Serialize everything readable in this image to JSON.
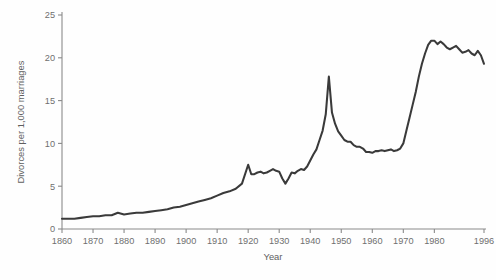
{
  "chart_data": {
    "type": "line",
    "title": "",
    "xlabel": "Year",
    "ylabel": "Divorces per 1,000 marriages",
    "xlim": [
      1860,
      1996
    ],
    "ylim": [
      0,
      25
    ],
    "grid": false,
    "legend": "none",
    "xticks": [
      1860,
      1870,
      1880,
      1890,
      1900,
      1910,
      1920,
      1930,
      1940,
      1950,
      1960,
      1970,
      1980,
      1996
    ],
    "xticklabels": [
      "1860",
      "1870",
      "1880",
      "1890",
      "1900",
      "1910",
      "1920",
      "1930",
      "1940",
      "1950",
      "1960",
      "1970",
      "1980",
      "1996"
    ],
    "yticks": [
      0,
      5,
      10,
      15,
      20,
      25
    ],
    "yticklabels": [
      "0",
      "5",
      "10",
      "15",
      "20",
      "25"
    ],
    "line_color": "#3a3a3a",
    "axis_color": "#8a8a8a",
    "background_color": "#ffffff",
    "series": [
      {
        "name": "Divorces per 1,000 marriages",
        "x": [
          1860,
          1862,
          1864,
          1866,
          1868,
          1870,
          1872,
          1874,
          1876,
          1878,
          1880,
          1882,
          1884,
          1886,
          1888,
          1890,
          1892,
          1894,
          1896,
          1898,
          1900,
          1902,
          1904,
          1906,
          1908,
          1910,
          1912,
          1914,
          1916,
          1918,
          1920,
          1921,
          1922,
          1923,
          1924,
          1925,
          1926,
          1927,
          1928,
          1929,
          1930,
          1931,
          1932,
          1933,
          1934,
          1935,
          1936,
          1937,
          1938,
          1939,
          1940,
          1941,
          1942,
          1943,
          1944,
          1945,
          1946,
          1947,
          1948,
          1949,
          1950,
          1951,
          1952,
          1953,
          1954,
          1955,
          1956,
          1957,
          1958,
          1959,
          1960,
          1961,
          1962,
          1963,
          1964,
          1965,
          1966,
          1967,
          1968,
          1969,
          1970,
          1971,
          1972,
          1973,
          1974,
          1975,
          1976,
          1977,
          1978,
          1979,
          1980,
          1981,
          1982,
          1983,
          1984,
          1985,
          1986,
          1987,
          1988,
          1989,
          1990,
          1991,
          1992,
          1993,
          1994,
          1995,
          1996
        ],
        "y": [
          1.2,
          1.2,
          1.2,
          1.3,
          1.4,
          1.5,
          1.5,
          1.6,
          1.6,
          1.9,
          1.7,
          1.8,
          1.9,
          1.9,
          2.0,
          2.1,
          2.2,
          2.3,
          2.5,
          2.6,
          2.8,
          3.0,
          3.2,
          3.4,
          3.6,
          3.9,
          4.2,
          4.4,
          4.7,
          5.3,
          7.5,
          6.4,
          6.4,
          6.6,
          6.7,
          6.5,
          6.6,
          6.8,
          7.0,
          6.8,
          6.7,
          5.9,
          5.3,
          5.9,
          6.6,
          6.5,
          6.8,
          7.0,
          6.9,
          7.3,
          8.0,
          8.7,
          9.3,
          10.4,
          11.5,
          13.4,
          17.8,
          13.6,
          12.3,
          11.4,
          10.9,
          10.4,
          10.2,
          10.2,
          9.8,
          9.6,
          9.6,
          9.4,
          9.0,
          9.0,
          8.9,
          9.1,
          9.1,
          9.2,
          9.1,
          9.2,
          9.3,
          9.1,
          9.2,
          9.4,
          10.0,
          11.5,
          13.0,
          14.5,
          16.0,
          17.8,
          19.3,
          20.5,
          21.5,
          22.0,
          22.0,
          21.6,
          21.9,
          21.6,
          21.2,
          21.0,
          21.2,
          21.4,
          21.0,
          20.6,
          20.7,
          20.9,
          20.5,
          20.3,
          20.8,
          20.3,
          19.3
        ]
      }
    ]
  }
}
